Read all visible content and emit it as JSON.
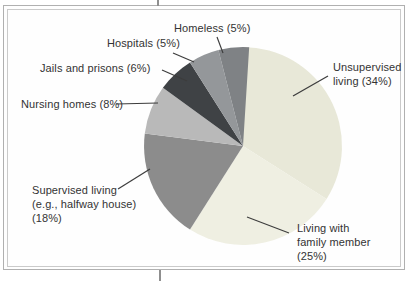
{
  "page": {
    "background_color": "#ffffff",
    "frame_outer_color": "#b0b0b0",
    "frame_inner_color": "#cacaca",
    "crop_mark_color": "#8f8f8f",
    "text_color": "#333333",
    "leader_line_color": "#3c3c3c"
  },
  "chart_data": {
    "type": "pie",
    "legend_position": "none",
    "label_style": "outside-with-leader-lines",
    "start_angle": "12-oclock",
    "direction": "clockwise",
    "total_pct": 100,
    "slices": [
      {
        "label": "Unsupervised living",
        "pct": 34,
        "color": "#e8e8d8",
        "display": "Unsupervised\nliving (34%)"
      },
      {
        "label": "Living with family member",
        "pct": 25,
        "color": "#efefe2",
        "display": "Living with\nfamily member\n(25%)"
      },
      {
        "label": "Supervised living (e.g., halfway house)",
        "pct": 18,
        "color": "#8c8c8c",
        "display": "Supervised living\n(e.g., halfway house)\n(18%)"
      },
      {
        "label": "Nursing homes",
        "pct": 8,
        "color": "#b9b9b9",
        "display": "Nursing homes (8%)"
      },
      {
        "label": "Jails and prisons",
        "pct": 6,
        "color": "#3f4245",
        "display": "Jails and prisons (6%)"
      },
      {
        "label": "Hospitals",
        "pct": 5,
        "color": "#94979a",
        "display": "Hospitals (5%)"
      },
      {
        "label": "Homeless",
        "pct": 5,
        "color": "#7f8285",
        "display": "Homeless (5%)"
      }
    ]
  }
}
